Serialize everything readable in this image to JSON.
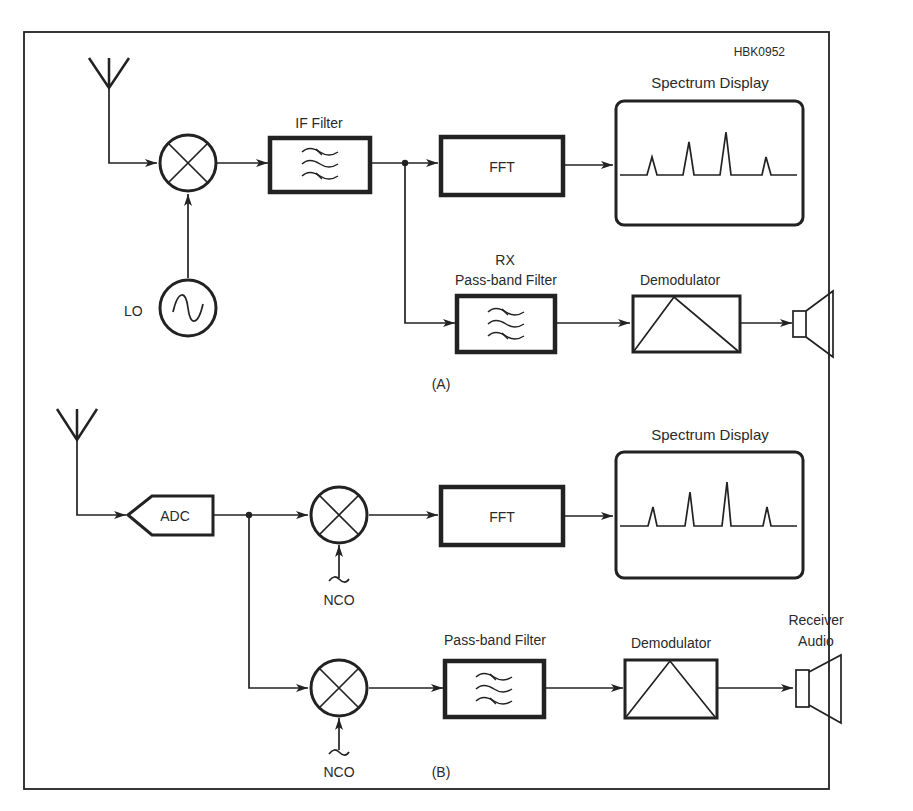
{
  "figure_id": "HBK0952",
  "panel_a": {
    "caption": "(A)",
    "blocks": {
      "lo": "LO",
      "if_filter": "IF Filter",
      "fft": "FFT",
      "spectrum_display": "Spectrum Display",
      "rx_filter_line1": "RX",
      "rx_filter_line2": "Pass-band Filter",
      "demodulator": "Demodulator"
    },
    "icons": [
      "antenna-icon",
      "mixer-icon",
      "oscillator-icon",
      "bandpass-filter-icon",
      "demodulator-icon",
      "speaker-icon"
    ]
  },
  "panel_b": {
    "caption": "(B)",
    "blocks": {
      "adc": "ADC",
      "nco_top": "NCO",
      "nco_bottom": "NCO",
      "fft": "FFT",
      "spectrum_display": "Spectrum Display",
      "passband_filter": "Pass-band Filter",
      "demodulator": "Demodulator",
      "receiver_audio_line1": "Receiver",
      "receiver_audio_line2": "Audio"
    },
    "icons": [
      "antenna-icon",
      "adc-icon",
      "mixer-icon",
      "nco-icon",
      "bandpass-filter-icon",
      "demodulator-icon",
      "speaker-icon"
    ]
  },
  "colors": {
    "line": "#222222",
    "text": "#2a2a2a",
    "background": "#ffffff"
  }
}
